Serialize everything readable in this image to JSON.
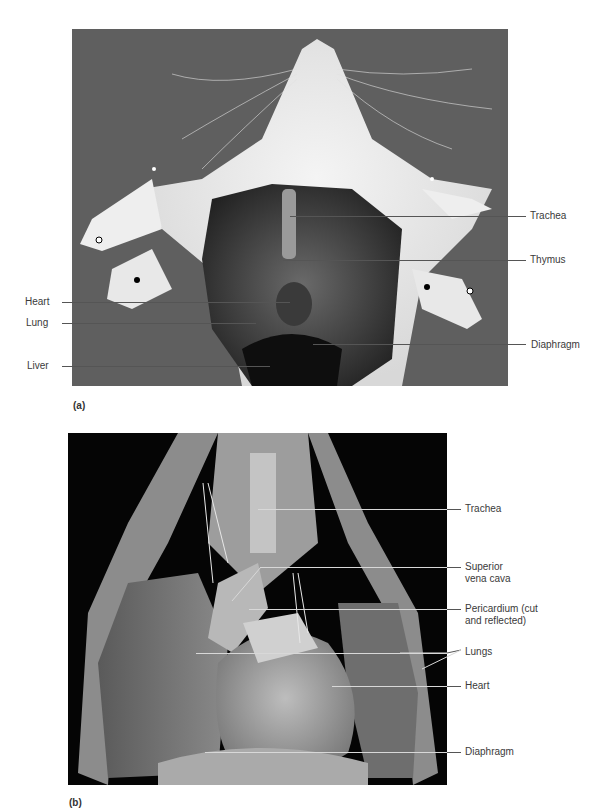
{
  "figure": {
    "panel_a": {
      "tag": "(a)",
      "labels_left": [
        "Heart",
        "Lung",
        "Liver"
      ],
      "labels_right": [
        "Trachea",
        "Thymus",
        "Diaphragm"
      ]
    },
    "panel_b": {
      "tag": "(b)",
      "labels_right": [
        {
          "line1": "Trachea"
        },
        {
          "line1": "Superior",
          "line2": "vena cava"
        },
        {
          "line1": "Pericardium (cut",
          "line2": "and reflected)"
        },
        {
          "line1": "Lungs"
        },
        {
          "line1": "Heart"
        },
        {
          "line1": "Diaphragm"
        }
      ]
    }
  }
}
